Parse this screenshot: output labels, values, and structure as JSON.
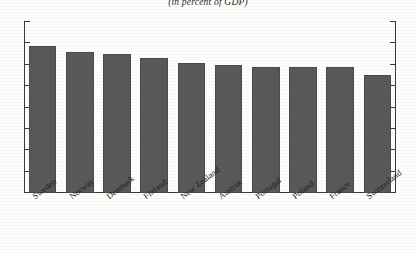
{
  "chart_data": {
    "type": "bar",
    "title": "",
    "subtitle": "(in percent of GDP)",
    "xlabel": "",
    "ylabel": "",
    "ylim": [
      0,
      8
    ],
    "yticks": [
      0,
      1,
      2,
      3,
      4,
      5,
      6,
      7,
      8
    ],
    "ytick_labels": [
      "0",
      "1",
      "2",
      "3",
      "4",
      "5",
      "6",
      "7",
      "8"
    ],
    "grid": false,
    "legend": null,
    "bar_color": "#595957",
    "categories": [
      "Sweden",
      "Norway",
      "Denmark",
      "Finland",
      "New Zealand",
      "Austria",
      "Portugal",
      "Poland",
      "France",
      "Switzerland"
    ],
    "values": [
      6.9,
      6.6,
      6.5,
      6.3,
      6.1,
      6.0,
      5.9,
      5.9,
      5.9,
      5.5
    ]
  }
}
